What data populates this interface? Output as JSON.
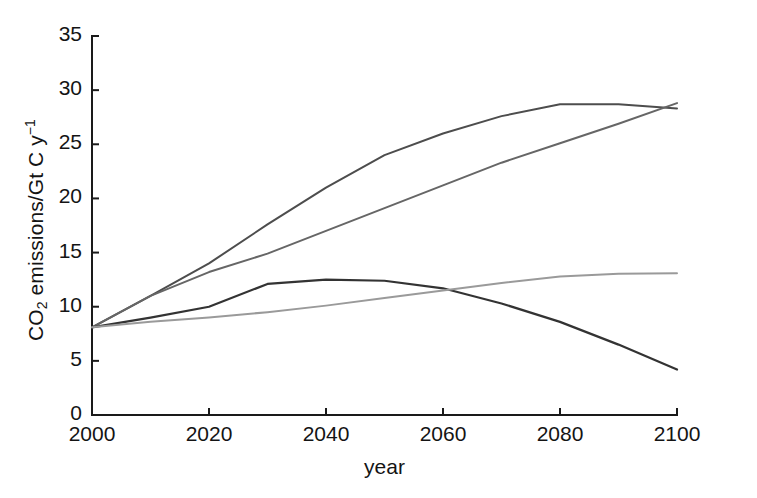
{
  "chart_data": {
    "type": "line",
    "title": "",
    "xlabel": "year",
    "ylabel": "CO2 emissions/Gt C y-1",
    "ylabel_parts": {
      "prefix": "CO",
      "sub": "2",
      "mid": " emissions/Gt C y",
      "sup": "−1"
    },
    "xlim": [
      2000,
      2100
    ],
    "ylim": [
      0,
      35
    ],
    "xticks": [
      2000,
      2020,
      2040,
      2060,
      2080,
      2100
    ],
    "xtick_labels": [
      "2000",
      "2020",
      "2040",
      "2060",
      "2080",
      "2100"
    ],
    "yticks": [
      0,
      5,
      10,
      15,
      20,
      25,
      30,
      35
    ],
    "ytick_labels": [
      "0",
      "5",
      "10",
      "15",
      "20",
      "25",
      "30",
      "35"
    ],
    "grid": false,
    "legend": "none",
    "x": [
      2000,
      2010,
      2020,
      2030,
      2040,
      2050,
      2060,
      2070,
      2080,
      2090,
      2100
    ],
    "series": [
      {
        "name": "A1FI-like high growth scenario",
        "color": "#4d4d4d",
        "width": 2.0,
        "values": [
          8.1,
          11.0,
          14.0,
          17.6,
          21.0,
          24.0,
          26.0,
          27.6,
          28.7,
          28.7,
          28.3
        ]
      },
      {
        "name": "A2-like scenario",
        "color": "#666666",
        "width": 2.0,
        "values": [
          8.1,
          11.0,
          13.2,
          14.9,
          17.0,
          19.1,
          21.2,
          23.3,
          25.1,
          26.9,
          28.8
        ]
      },
      {
        "name": "B2-like stabilising scenario",
        "color": "#333333",
        "width": 2.2,
        "values": [
          8.1,
          9.0,
          10.0,
          12.1,
          12.5,
          12.4,
          11.7,
          10.3,
          8.6,
          6.5,
          4.2
        ]
      },
      {
        "name": "B1-like low growth scenario",
        "color": "#9a9a9a",
        "width": 2.0,
        "values": [
          8.1,
          8.6,
          9.0,
          9.5,
          10.1,
          10.8,
          11.5,
          12.2,
          12.8,
          13.05,
          13.1
        ]
      }
    ],
    "annotations": [
      {
        "text": "All scenarios begin at about 8.1 Gt C y-1 in 2000",
        "visible": false
      }
    ]
  },
  "axes": {
    "axis_color": "#1a1a1a",
    "tick_length": 7,
    "spine_width": 2
  }
}
